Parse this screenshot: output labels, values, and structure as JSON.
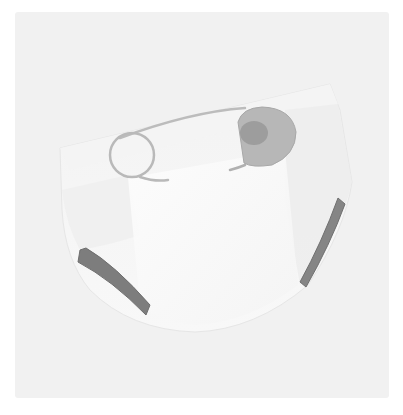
{
  "image": {
    "subject": "Cloth diaper fastened with a safety pin",
    "style": "soft grayscale illustration",
    "alt": "Illustration of a white cloth diaper with a safety pin"
  },
  "colors": {
    "page_background": "#ffffff",
    "frame_background": "#f1f1f1",
    "diaper_body": "#f7f7f7",
    "diaper_shade": "#e9e9e9",
    "diaper_center_panel": "#fbfbfb",
    "leg_elastic": "#7d7d7d",
    "pin_wire": "#b9b9b9",
    "pin_head": "#b5b5b5",
    "pin_head_highlight": "#9c9c9c"
  },
  "elements": {
    "diaper": "diaper",
    "safety_pin": "safety pin",
    "left_leg_band": "left leg elastic",
    "right_leg_band": "right leg elastic"
  }
}
